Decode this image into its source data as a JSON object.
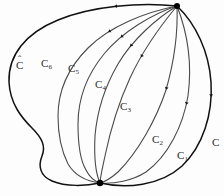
{
  "figure": {
    "type": "mathematical-diagram",
    "background_color": "#fdfdfd",
    "outer_curve_color": "#111111",
    "inner_curve_color": "#4a4a4a",
    "vertex_color": "#000000",
    "top_vertex": {
      "x": 177,
      "y": 6
    },
    "bottom_vertex": {
      "x": 100,
      "y": 183
    },
    "labels": [
      {
        "id": "C-hat",
        "base": "C",
        "subscript": "",
        "accent": "hat",
        "x": 16,
        "y": 60
      },
      {
        "id": "C6",
        "base": "C",
        "subscript": "6",
        "accent": "",
        "x": 41,
        "y": 58
      },
      {
        "id": "C5",
        "base": "C",
        "subscript": "5",
        "accent": "",
        "x": 68,
        "y": 63
      },
      {
        "id": "C4",
        "base": "C",
        "subscript": "4",
        "accent": "",
        "x": 95,
        "y": 79
      },
      {
        "id": "C3",
        "base": "C",
        "subscript": "3",
        "accent": "",
        "x": 120,
        "y": 101
      },
      {
        "id": "C2",
        "base": "C",
        "subscript": "2",
        "accent": "",
        "x": 152,
        "y": 134
      },
      {
        "id": "C1",
        "base": "C",
        "subscript": "1",
        "accent": "",
        "x": 177,
        "y": 150
      },
      {
        "id": "C",
        "base": "C",
        "subscript": "",
        "accent": "",
        "x": 212,
        "y": 137
      }
    ],
    "curves": [
      {
        "id": "C-hat-outer",
        "label_id": "C-hat",
        "stroke": "#111111",
        "stroke_width": 1.5,
        "path": "M 177 6 C 140 2 92 6 58 20 C 26 33 8 55 9 82 C 10 104 22 118 32 128 C 42 138 46 146 42 156 C 38 166 40 176 52 181 C 66 187 86 186 100 183",
        "arrow_t": 0.17
      },
      {
        "id": "C6-curve",
        "label_id": "C6",
        "stroke": "#4a4a4a",
        "stroke_width": 1.1,
        "path": "M 177 6 C 146 12 110 26 88 48 C 68 68 58 92 58 116 C 58 138 62 152 68 164 C 74 174 84 181 100 183",
        "arrow_t": 0.28
      },
      {
        "id": "C5-curve",
        "label_id": "C5",
        "stroke": "#4a4a4a",
        "stroke_width": 1.1,
        "path": "M 177 6 C 152 14 122 32 104 54 C 86 76 78 100 78 124 C 78 146 80 160 86 170 C 90 178 94 181 100 183",
        "arrow_t": 0.28
      },
      {
        "id": "C4-curve",
        "label_id": "C4",
        "stroke": "#4a4a4a",
        "stroke_width": 1.1,
        "path": "M 177 6 C 157 18 132 40 118 64 C 104 88 97 112 95 136 C 94 156 95 172 100 183",
        "arrow_t": 0.3
      },
      {
        "id": "C3-curve",
        "label_id": "C3",
        "stroke": "#4a4a4a",
        "stroke_width": 1.1,
        "path": "M 177 6 C 162 24 142 52 130 78 C 118 104 110 132 105 156 C 102 170 100 178 100 183",
        "arrow_t": 0.32
      },
      {
        "id": "C2-curve",
        "label_id": "C2",
        "stroke": "#4a4a4a",
        "stroke_width": 1.1,
        "path": "M 177 6 C 178 32 174 62 166 90 C 156 120 138 152 118 172 C 110 179 104 182 100 183",
        "arrow_t": 0.42
      },
      {
        "id": "C1-curve",
        "label_id": "C1",
        "stroke": "#4a4a4a",
        "stroke_width": 1.1,
        "path": "M 177 6 C 188 34 192 66 188 96 C 183 126 168 156 146 172 C 132 181 114 184 100 183",
        "arrow_t": 0.44
      },
      {
        "id": "C-outer-right",
        "label_id": "C",
        "stroke": "#111111",
        "stroke_width": 1.5,
        "path": "M 177 6 C 196 24 209 52 211 82 C 213 114 203 146 182 166 C 160 186 126 189 100 183",
        "arrow_t": 0.38
      }
    ],
    "arrow_marks": {
      "color": "#111111",
      "size": 3.2,
      "count": 8
    }
  }
}
